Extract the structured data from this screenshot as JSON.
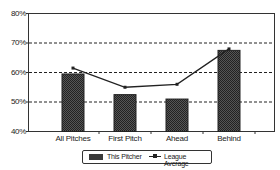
{
  "chart_data": {
    "type": "bar",
    "title": "",
    "xlabel": "",
    "ylabel": "",
    "categories": [
      "All Pitches",
      "First Pitch",
      "Ahead",
      "Behind"
    ],
    "series": [
      {
        "name": "This Pitcher",
        "type": "bar",
        "values": [
          59.5,
          52.5,
          51,
          67.5
        ],
        "color": "#3a3a3a"
      },
      {
        "name": "League Average",
        "type": "line",
        "values": [
          61.5,
          55,
          56,
          68
        ],
        "color": "#222222"
      }
    ],
    "ylim": [
      40,
      80
    ],
    "yticks": [
      "40%",
      "50%",
      "60%",
      "70%",
      "80%"
    ],
    "grid": "dashed horizontal at 50%, 60%, 70%",
    "legend_position": "bottom"
  },
  "axis": {
    "y_labels": [
      "80%",
      "70%",
      "60%",
      "50%",
      "40%"
    ],
    "x_labels": [
      "All Pitches",
      "First Pitch",
      "Ahead",
      "Behind"
    ]
  },
  "legend": {
    "bar_label": "This Pitcher",
    "line_label": "League Average"
  }
}
